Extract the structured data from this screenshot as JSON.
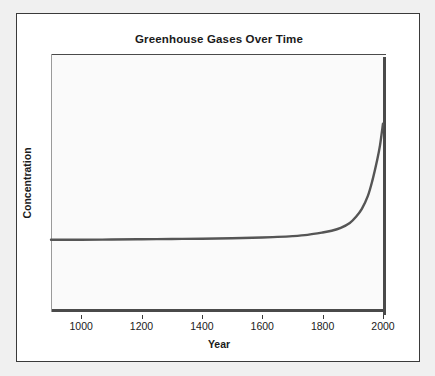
{
  "chart_data": {
    "type": "line",
    "title": "Greenhouse Gases Over Time",
    "xlabel": "Year",
    "ylabel": "Concentration",
    "xlim": [
      900,
      2010
    ],
    "ylim": [
      0,
      1
    ],
    "grid": false,
    "legend": false,
    "legend_position": "none",
    "xticks": [
      "1000",
      "1200",
      "1400",
      "1600",
      "1800",
      "2000"
    ],
    "xtick_values": [
      1000,
      1200,
      1400,
      1600,
      1800,
      2000
    ],
    "yticks": [],
    "line_color": "#555555",
    "plot_background": "#fafafa",
    "series": [
      {
        "name": "Greenhouse gas concentration",
        "x": [
          900,
          1000,
          1100,
          1200,
          1300,
          1400,
          1500,
          1600,
          1650,
          1700,
          1750,
          1800,
          1830,
          1860,
          1890,
          1910,
          1930,
          1950,
          1965,
          1980,
          1990,
          2000
        ],
        "values": [
          0.28,
          0.28,
          0.281,
          0.282,
          0.283,
          0.284,
          0.286,
          0.289,
          0.291,
          0.294,
          0.299,
          0.308,
          0.315,
          0.326,
          0.345,
          0.368,
          0.4,
          0.45,
          0.51,
          0.585,
          0.645,
          0.73
        ]
      }
    ]
  },
  "colors": {
    "page_background": "#f0f0f0",
    "card_background": "#ffffff",
    "card_border": "#3a3a3a",
    "axis": "#4a4a4a",
    "text": "#1a1a1a",
    "line": "#555555"
  }
}
